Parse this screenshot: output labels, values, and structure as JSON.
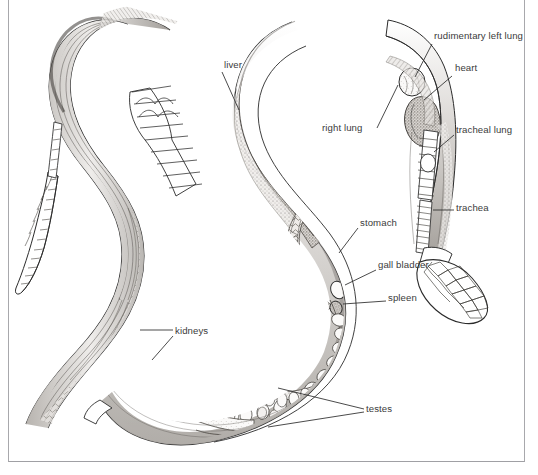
{
  "figure": {
    "type": "anatomical-illustration",
    "views": [
      {
        "name": "dorsal-external-view",
        "position": "left"
      },
      {
        "name": "internal-anatomy-view",
        "position": "right"
      }
    ],
    "background_color": "#ffffff",
    "ink_color": "#2b2b2b",
    "frame_color": "#a8a8ac",
    "label_color": "#3b3b3b"
  },
  "labels": [
    {
      "id": "liver",
      "text": "liver",
      "x": 224,
      "y": 66,
      "align": "left"
    },
    {
      "id": "rudimentary-left-lung",
      "text": "rudimentary left lung",
      "x": 434,
      "y": 37,
      "align": "left"
    },
    {
      "id": "heart",
      "text": "heart",
      "x": 455,
      "y": 69,
      "align": "left"
    },
    {
      "id": "right-lung",
      "text": "right lung",
      "x": 322,
      "y": 128,
      "align": "left"
    },
    {
      "id": "tracheal-lung",
      "text": "tracheal lung",
      "x": 456,
      "y": 130,
      "align": "left"
    },
    {
      "id": "trachea",
      "text": "trachea",
      "x": 456,
      "y": 208,
      "align": "left"
    },
    {
      "id": "stomach",
      "text": "stomach",
      "x": 360,
      "y": 223,
      "align": "left"
    },
    {
      "id": "gall-bladder",
      "text": "gall bladder",
      "x": 378,
      "y": 265,
      "align": "left"
    },
    {
      "id": "spleen",
      "text": "spleen",
      "x": 388,
      "y": 298,
      "align": "left"
    },
    {
      "id": "kidneys",
      "text": "kidneys",
      "x": 175,
      "y": 331,
      "align": "left"
    },
    {
      "id": "testes",
      "text": "testes",
      "x": 366,
      "y": 409,
      "align": "left"
    }
  ],
  "leader_lines": [
    {
      "for": "liver",
      "points": [
        [
          222,
          72
        ],
        [
          239,
          110
        ]
      ]
    },
    {
      "for": "rudimentary-left-lung",
      "points": [
        [
          432,
          44
        ],
        [
          415,
          77
        ]
      ]
    },
    {
      "for": "heart",
      "points": [
        [
          452,
          76
        ],
        [
          424,
          100
        ]
      ]
    },
    {
      "for": "right-lung",
      "points": [
        [
          377,
          128
        ],
        [
          398,
          85
        ]
      ]
    },
    {
      "for": "tracheal-lung",
      "points": [
        [
          454,
          135
        ],
        [
          434,
          152
        ]
      ]
    },
    {
      "for": "trachea",
      "points": [
        [
          454,
          210
        ],
        [
          433,
          210
        ]
      ]
    },
    {
      "for": "stomach",
      "points": [
        [
          358,
          228
        ],
        [
          339,
          253
        ]
      ]
    },
    {
      "for": "gall-bladder",
      "points": [
        [
          376,
          270
        ],
        [
          345,
          285
        ]
      ]
    },
    {
      "for": "spleen",
      "points": [
        [
          386,
          301
        ],
        [
          343,
          304
        ]
      ]
    },
    {
      "for": "kidneys",
      "points": [
        [
          173,
          330
        ],
        [
          140,
          330
        ]
      ]
    },
    {
      "for": "kidneys-2",
      "points": [
        [
          173,
          336
        ],
        [
          152,
          360
        ]
      ]
    },
    {
      "for": "testes-1",
      "points": [
        [
          364,
          409
        ],
        [
          278,
          388
        ]
      ]
    },
    {
      "for": "testes-2",
      "points": [
        [
          364,
          412
        ],
        [
          268,
          427
        ]
      ]
    }
  ],
  "anatomy_structures": {
    "left_view": [
      "dorsal scalation",
      "ventral scale bands",
      "tail tip"
    ],
    "right_view": [
      "liver",
      "right lung",
      "rudimentary left lung",
      "heart",
      "tracheal lung",
      "trachea",
      "stomach",
      "gall bladder",
      "spleen",
      "kidneys",
      "testes",
      "head scales"
    ]
  }
}
